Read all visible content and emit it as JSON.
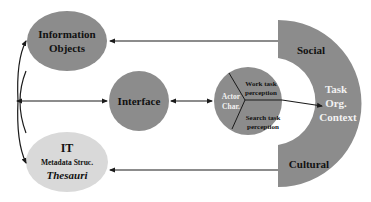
{
  "colors": {
    "node_dark": "#8c8c8c",
    "node_light": "#d9d9d9",
    "ring": "#8c8c8c",
    "arrow": "#1a1a1a",
    "text_dark": "#111111",
    "text_white": "#f2f2f2"
  },
  "nodes": {
    "information_objects": {
      "line1": "Information",
      "line2": "Objects"
    },
    "interface": {
      "label": "Interface"
    },
    "actor": {
      "center": {
        "line1": "Actor",
        "line2": "Char."
      },
      "work": {
        "line1": "Work task",
        "line2": "perception"
      },
      "search": {
        "line1": "Search task",
        "line2": "perception"
      }
    },
    "it": {
      "line1": "IT",
      "line2": "Metadata Struc.",
      "line3": "Thesauri"
    },
    "context": {
      "social": "Social",
      "cultural": "Cultural",
      "center": {
        "line1": "Task",
        "line2": "Org.",
        "line3": "Context"
      }
    }
  }
}
